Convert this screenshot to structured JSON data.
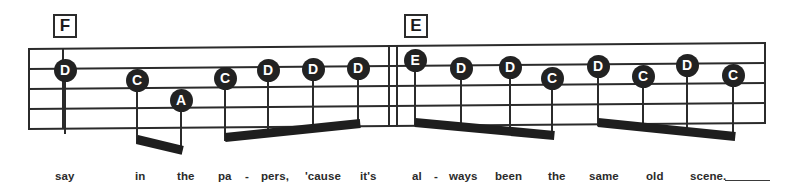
{
  "sheet": {
    "title": "music-notation-staff-system",
    "ink_color": "#222222",
    "paper_color": "#ffffff",
    "notehead_text_color": "#ffffff"
  },
  "rehearsal_marks": [
    {
      "label": "F",
      "x": 53,
      "y": 14
    },
    {
      "label": "E",
      "x": 404,
      "y": 14
    }
  ],
  "staff": {
    "left": 28,
    "right": 766,
    "top_left": 48,
    "top_right": 42,
    "line_count": 5,
    "line_gap": 20
  },
  "barlines": [
    {
      "name": "barline-start",
      "x": 28
    },
    {
      "name": "barline-measure-1",
      "x": 62
    },
    {
      "name": "barline-measure-2",
      "x": 388
    },
    {
      "name": "barline-measure-3",
      "x": 396
    },
    {
      "name": "barline-end",
      "x": 764
    }
  ],
  "notes": [
    {
      "label": "D",
      "x": 65,
      "y": 70,
      "name": "note-d-1"
    },
    {
      "label": "C",
      "x": 137,
      "y": 80,
      "name": "note-c-2"
    },
    {
      "label": "A",
      "x": 181,
      "y": 100,
      "name": "note-a-3"
    },
    {
      "label": "C",
      "x": 225,
      "y": 78,
      "name": "note-c-4"
    },
    {
      "label": "D",
      "x": 268,
      "y": 70,
      "name": "note-d-5"
    },
    {
      "label": "D",
      "x": 313,
      "y": 69,
      "name": "note-d-6"
    },
    {
      "label": "D",
      "x": 358,
      "y": 68,
      "name": "note-d-7"
    },
    {
      "label": "E",
      "x": 415,
      "y": 60,
      "name": "note-e-8"
    },
    {
      "label": "D",
      "x": 461,
      "y": 68,
      "name": "note-d-9"
    },
    {
      "label": "D",
      "x": 510,
      "y": 67,
      "name": "note-d-10"
    },
    {
      "label": "C",
      "x": 552,
      "y": 78,
      "name": "note-c-11"
    },
    {
      "label": "D",
      "x": 598,
      "y": 66,
      "name": "note-d-12"
    },
    {
      "label": "C",
      "x": 643,
      "y": 76,
      "name": "note-c-13"
    },
    {
      "label": "D",
      "x": 687,
      "y": 65,
      "name": "note-d-14"
    },
    {
      "label": "C",
      "x": 733,
      "y": 75,
      "name": "note-c-15"
    }
  ],
  "beams": [
    {
      "name": "beam-group-1",
      "x1": 137,
      "y1": 135,
      "x2": 183,
      "y2": 146
    },
    {
      "name": "beam-group-2",
      "x1": 225,
      "y1": 133,
      "x2": 360,
      "y2": 119
    },
    {
      "name": "beam-group-3",
      "x1": 415,
      "y1": 118,
      "x2": 554,
      "y2": 131
    },
    {
      "name": "beam-group-4",
      "x1": 598,
      "y1": 118,
      "x2": 735,
      "y2": 132
    }
  ],
  "lyrics": [
    {
      "text": "say",
      "x": 55,
      "name": "lyric-say"
    },
    {
      "text": "in",
      "x": 135,
      "name": "lyric-in"
    },
    {
      "text": "the",
      "x": 177,
      "name": "lyric-the-1"
    },
    {
      "text": "pa",
      "x": 218,
      "name": "lyric-pa"
    },
    {
      "text": "-",
      "x": 245,
      "name": "lyric-hyphen-1"
    },
    {
      "text": "pers,",
      "x": 261,
      "name": "lyric-pers"
    },
    {
      "text": "'cause",
      "x": 305,
      "name": "lyric-cause"
    },
    {
      "text": "it's",
      "x": 360,
      "name": "lyric-its"
    },
    {
      "text": "al",
      "x": 412,
      "name": "lyric-al"
    },
    {
      "text": "-",
      "x": 434,
      "name": "lyric-hyphen-2"
    },
    {
      "text": "ways",
      "x": 449,
      "name": "lyric-ways"
    },
    {
      "text": "been",
      "x": 495,
      "name": "lyric-been"
    },
    {
      "text": "the",
      "x": 548,
      "name": "lyric-the-2"
    },
    {
      "text": "same",
      "x": 589,
      "name": "lyric-same"
    },
    {
      "text": "old",
      "x": 646,
      "name": "lyric-old"
    },
    {
      "text": "scene.",
      "x": 690,
      "name": "lyric-scene"
    }
  ],
  "melisma": {
    "x": 725,
    "y": 180,
    "width": 45
  },
  "full_lyric_line": "say in the pa - pers, 'cause it's al - ways been the same old scene."
}
